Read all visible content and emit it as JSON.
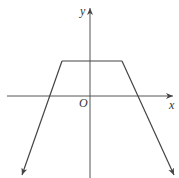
{
  "diagram": {
    "type": "function-graph",
    "axes": {
      "x_label": "x",
      "y_label": "y",
      "origin_label": "O"
    },
    "colors": {
      "stroke": "#444444",
      "background": "#ffffff"
    }
  }
}
